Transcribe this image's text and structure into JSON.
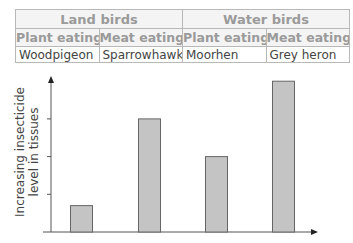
{
  "table": {
    "groups": [
      {
        "label": "Land birds"
      },
      {
        "label": "Water birds"
      }
    ],
    "subheaders": [
      "Plant eating",
      "Meat eating",
      "Plant eating",
      "Meat eating"
    ],
    "birds": [
      "Woodpigeon",
      "Sparrowhawk",
      "Moorhen",
      "Grey heron"
    ]
  },
  "chart_data": {
    "type": "bar",
    "title": "",
    "categories": [
      "Woodpigeon",
      "Sparrowhawk",
      "Moorhen",
      "Grey heron"
    ],
    "values": [
      0.7,
      3,
      2,
      4
    ],
    "xlabel": "",
    "ylabel": "Increasing insecticide level in tissues",
    "ylabel_lines": [
      "Increasing insecticide",
      "level in tissues"
    ],
    "ylim": [
      0,
      4.2
    ],
    "yticks": [
      1,
      2,
      3
    ],
    "ytick_labels": false,
    "grid": false,
    "bar_color": "#c4c4c4",
    "bar_edge_color": "#666666"
  }
}
